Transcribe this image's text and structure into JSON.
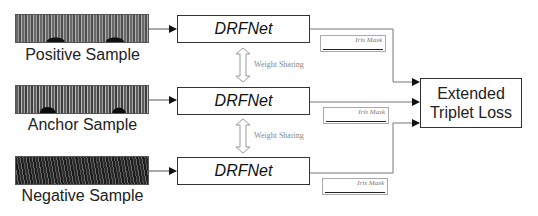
{
  "samples": [
    {
      "id": "positive",
      "label": "Positive Sample"
    },
    {
      "id": "anchor",
      "label": "Anchor Sample"
    },
    {
      "id": "negative",
      "label": "Negative Sample"
    }
  ],
  "networks": [
    {
      "label": "DRFNet"
    },
    {
      "label": "DRFNet"
    },
    {
      "label": "DRFNet"
    }
  ],
  "weight_sharing": [
    {
      "label": "Weight Sharing"
    },
    {
      "label": "Weight Sharing"
    }
  ],
  "masks": [
    {
      "label": "Iris Mask"
    },
    {
      "label": "Iris Mask"
    },
    {
      "label": "Iris Mask"
    }
  ],
  "loss": {
    "line1": "Extended",
    "line2": "Triplet Loss"
  },
  "colors": {
    "line": "#555555",
    "box_border": "#333333",
    "ws_arrow": "#aaaaaa"
  }
}
